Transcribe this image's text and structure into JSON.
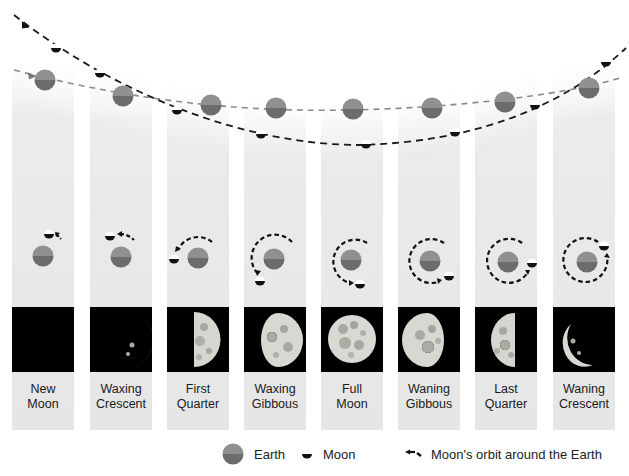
{
  "diagram": {
    "colors": {
      "earth_top": "#8f8f8f",
      "earth_bottom": "#6d6d6d",
      "moon_dark": "#111111",
      "moon_light": "#ffffff",
      "earth_path": "#8a8a8a",
      "moon_path": "#1a1a1a",
      "column_bg": "#e8e8e8",
      "phase_bg": "#000000"
    },
    "phases": [
      {
        "id": "new-moon",
        "line1": "New",
        "line2": "Moon"
      },
      {
        "id": "waxing-crescent",
        "line1": "Waxing",
        "line2": "Crescent"
      },
      {
        "id": "first-quarter",
        "line1": "First",
        "line2": "Quarter"
      },
      {
        "id": "waxing-gibbous",
        "line1": "Waxing",
        "line2": "Gibbous"
      },
      {
        "id": "full-moon",
        "line1": "Full",
        "line2": "Moon"
      },
      {
        "id": "waning-gibbous",
        "line1": "Waning",
        "line2": "Gibbous"
      },
      {
        "id": "last-quarter",
        "line1": "Last",
        "line2": "Quarter"
      },
      {
        "id": "waning-crescent",
        "line1": "Waning",
        "line2": "Crescent"
      }
    ]
  },
  "legend": {
    "earth_label": "Earth",
    "moon_label": "Moon",
    "orbit_label": "Moon's orbit around the Earth",
    "earth_icon": "earth-icon",
    "moon_icon": "moon-icon",
    "orbit_icon": "orbit-arrow-icon"
  }
}
